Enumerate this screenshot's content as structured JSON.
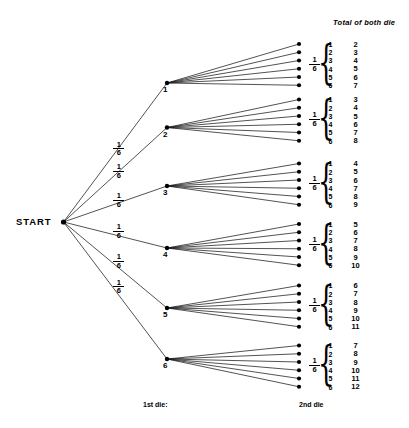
{
  "diagram": {
    "title_column": "Total of both die",
    "start_label": "START",
    "axis_first": "1st die:",
    "axis_second": "2nd die",
    "branch_probability": {
      "numerator": "1",
      "denominator": "6"
    },
    "first_die_nodes": [
      "1",
      "2",
      "3",
      "4",
      "5",
      "6"
    ],
    "groups": [
      {
        "first_die": "1",
        "probability": {
          "numerator": "1",
          "denominator": "6"
        },
        "second_die": [
          "1",
          "2",
          "3",
          "4",
          "5",
          "6"
        ],
        "totals": [
          "2",
          "3",
          "4",
          "5",
          "6",
          "7"
        ]
      },
      {
        "first_die": "2",
        "probability": {
          "numerator": "1",
          "denominator": "6"
        },
        "second_die": [
          "1",
          "2",
          "3",
          "4",
          "5",
          "6"
        ],
        "totals": [
          "3",
          "4",
          "5",
          "6",
          "7",
          "8"
        ]
      },
      {
        "first_die": "3",
        "probability": {
          "numerator": "1",
          "denominator": "6"
        },
        "second_die": [
          "1",
          "2",
          "3",
          "4",
          "5",
          "6"
        ],
        "totals": [
          "4",
          "5",
          "6",
          "7",
          "8",
          "9"
        ]
      },
      {
        "first_die": "4",
        "probability": {
          "numerator": "1",
          "denominator": "6"
        },
        "second_die": [
          "1",
          "2",
          "3",
          "4",
          "5",
          "6"
        ],
        "totals": [
          "5",
          "6",
          "7",
          "8",
          "9",
          "10"
        ]
      },
      {
        "first_die": "5",
        "probability": {
          "numerator": "1",
          "denominator": "6"
        },
        "second_die": [
          "1",
          "2",
          "3",
          "4",
          "5",
          "6"
        ],
        "totals": [
          "6",
          "7",
          "8",
          "9",
          "10",
          "11"
        ]
      },
      {
        "first_die": "6",
        "probability": {
          "numerator": "1",
          "denominator": "6"
        },
        "second_die": [
          "1",
          "2",
          "3",
          "4",
          "5",
          "6"
        ],
        "totals": [
          "7",
          "8",
          "9",
          "10",
          "11",
          "12"
        ]
      }
    ],
    "colors": {
      "line": "#1a1a1a",
      "node": "#000000",
      "background": "#ffffff",
      "text": "#000000"
    }
  }
}
